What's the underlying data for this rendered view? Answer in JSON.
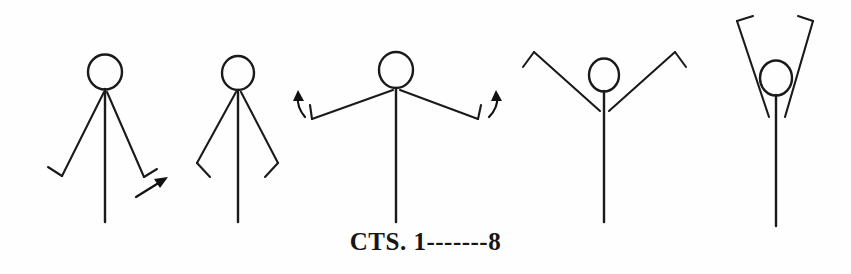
{
  "document": {
    "kind": "hand-drawn stick-figure movement sequence",
    "background_color": "#fefefe",
    "ink_color": "#1a1a1a",
    "width": 851,
    "height": 274
  },
  "caption": {
    "label": "CTS. 1-------8",
    "prefix": "CTS.",
    "start_count": "1",
    "dash_run": "-------",
    "end_count": "8"
  },
  "figures": [
    {
      "index": 1,
      "name": "figure-arms-down",
      "pose": "arms hanging down at sides, hands bent",
      "head": {
        "cx": 105,
        "cy": 72,
        "rx": 17,
        "ry": 17.5
      },
      "spine": {
        "x1": 105,
        "y1": 90,
        "x2": 105,
        "y2": 222
      },
      "left_arm": "M104,92 L62,176",
      "left_hand": "M62,176 L48,168",
      "right_arm": "M107,92 L143,176",
      "right_hand": "M143,176 L156,168",
      "has_motion_arrow": true,
      "motion_arrow_label": "arrow-up-right"
    },
    {
      "index": 2,
      "name": "figure-arms-low-diagonal",
      "pose": "arms low and angled out from body, wrists bent inward",
      "head": {
        "cx": 238,
        "cy": 73,
        "rx": 16,
        "ry": 17
      },
      "spine": {
        "x1": 238,
        "y1": 90,
        "x2": 238,
        "y2": 222
      },
      "left_arm": "M236,92 L198,163",
      "left_hand": "M198,163 L210,176",
      "right_arm": "M240,92 L277,163",
      "right_hand": "M277,163 L265,176",
      "has_motion_arrow": false,
      "motion_arrow_label": ""
    },
    {
      "index": 3,
      "name": "figure-arms-horizontal",
      "pose": "arms extended straight out to the sides at shoulder height, hands bent up",
      "head": {
        "cx": 396,
        "cy": 70,
        "rx": 17,
        "ry": 18
      },
      "spine": {
        "x1": 396,
        "y1": 89,
        "x2": 396,
        "y2": 222
      },
      "left_arm": "M394,90 L312,118",
      "left_hand": "M312,118 L310,104",
      "right_arm": "M399,90 L478,118",
      "right_hand": "M478,118 L481,104",
      "has_motion_arrow": true,
      "motion_arrow_label": "curved-arrows-up-both-hands"
    },
    {
      "index": 4,
      "name": "figure-arms-diagonal-up",
      "pose": "arms raised diagonally upward in a wide V, hands bent outward",
      "head": {
        "cx": 604,
        "cy": 75,
        "rx": 15,
        "ry": 16.5
      },
      "spine": {
        "x1": 604,
        "y1": 92,
        "x2": 604,
        "y2": 222
      },
      "left_arm": "M601,110 L534,52",
      "left_hand": "M534,52 L524,66",
      "right_arm": "M608,110 L674,52",
      "right_hand": "M674,52 L684,66",
      "has_motion_arrow": false,
      "motion_arrow_label": ""
    },
    {
      "index": 5,
      "name": "figure-arms-overhead",
      "pose": "arms raised high overhead in a narrow V, hands bent inward",
      "head": {
        "cx": 776,
        "cy": 78,
        "rx": 16,
        "ry": 17.5
      },
      "spine": {
        "x1": 776,
        "y1": 96,
        "x2": 776,
        "y2": 226
      },
      "left_arm": "M769,116 L738,20",
      "left_hand": "M738,20 L752,16",
      "right_arm": "M784,116 L812,20",
      "right_hand": "M812,20 L799,16",
      "has_motion_arrow": false,
      "motion_arrow_label": ""
    }
  ],
  "motion_arrows": [
    {
      "name": "arrow-up-right-figure1",
      "description": "straight diagonal arrow pointing up and to the right beside figure 1's right hand"
    },
    {
      "name": "arrow-up-left-hand-figure3",
      "description": "short curved arrow pointing up at figure 3's left hand"
    },
    {
      "name": "arrow-up-right-hand-figure3",
      "description": "short curved arrow pointing up at figure 3's right hand"
    }
  ]
}
